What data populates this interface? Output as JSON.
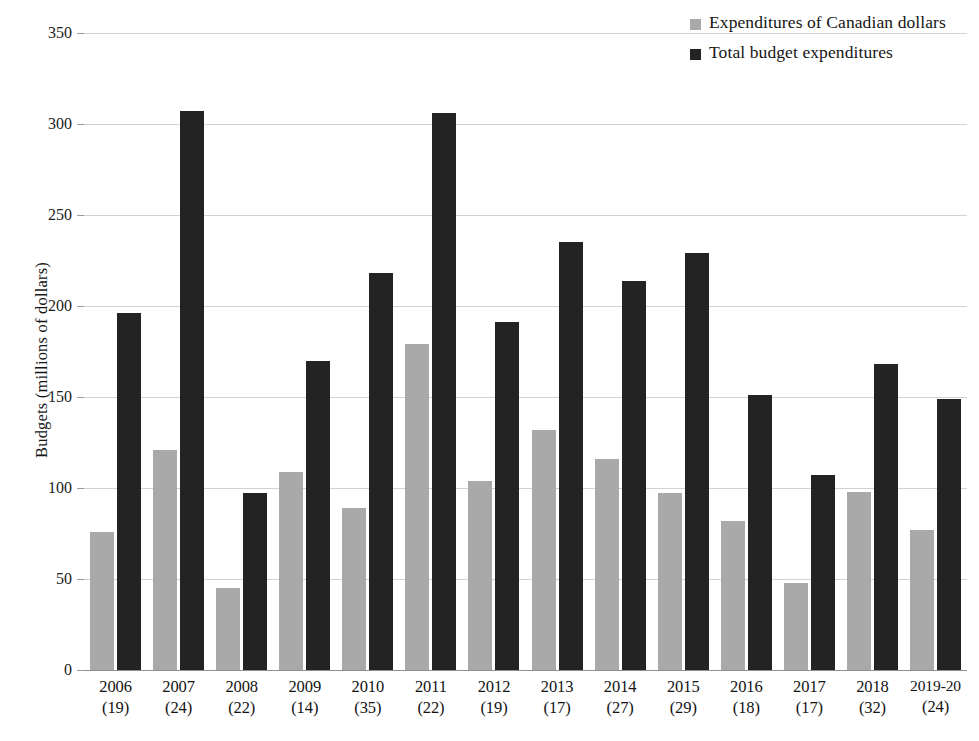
{
  "chart_data": {
    "type": "bar",
    "title": "",
    "xlabel": "",
    "ylabel": "Budgets (millions of dollars)",
    "ylim": [
      0,
      350
    ],
    "yticks": [
      0,
      50,
      100,
      150,
      200,
      250,
      300,
      350
    ],
    "ytick_labels": [
      "0",
      "50",
      "100",
      "150",
      "200",
      "250",
      "300",
      "350"
    ],
    "grid": true,
    "legend_position": "top-right",
    "categories": [
      "2006\n(19)",
      "2007\n(24)",
      "2008\n(22)",
      "2009\n(14)",
      "2010\n(35)",
      "2011\n(22)",
      "2012\n(19)",
      "2013\n(17)",
      "2014\n(27)",
      "2015\n(29)",
      "2016\n(18)",
      "2017\n(17)",
      "2018\n(32)",
      "2019-20\n(24)"
    ],
    "category_years": [
      "2006",
      "2007",
      "2008",
      "2009",
      "2010",
      "2011",
      "2012",
      "2013",
      "2014",
      "2015",
      "2016",
      "2017",
      "2018",
      "2019-20"
    ],
    "category_counts": [
      "(19)",
      "(24)",
      "(22)",
      "(14)",
      "(35)",
      "(22)",
      "(19)",
      "(17)",
      "(27)",
      "(29)",
      "(18)",
      "(17)",
      "(32)",
      "(24)"
    ],
    "series": [
      {
        "name": "Expenditures of Canadian dollars",
        "color": "#a9a9a9",
        "values": [
          76,
          121,
          45,
          109,
          89,
          179,
          104,
          132,
          116,
          97,
          82,
          48,
          98,
          77
        ]
      },
      {
        "name": "Total budget expenditures",
        "color": "#232323",
        "values": [
          196,
          307,
          97,
          170,
          218,
          306,
          191,
          235,
          214,
          229,
          151,
          107,
          168,
          149
        ]
      }
    ]
  },
  "legend": {
    "items": [
      {
        "label": "Expenditures of Canadian dollars",
        "color": "#a9a9a9"
      },
      {
        "label": "Total budget expenditures",
        "color": "#232323"
      }
    ]
  }
}
